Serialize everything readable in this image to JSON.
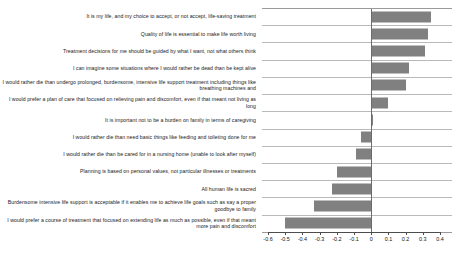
{
  "chart_data": {
    "type": "bar",
    "orientation": "horizontal",
    "title": "",
    "subtitle": "",
    "xlabel": "",
    "ylabel": "",
    "xlim": [
      -0.6,
      0.4
    ],
    "grid": true,
    "legend": null,
    "bar_color": "#808080",
    "zero_line_color": "#6b6b6b",
    "tick_labels": [
      "-0.6",
      "-0.5",
      "-0.4",
      "-0.3",
      "-0.2",
      "-0.1",
      "0",
      "0.1",
      "0.2",
      "0.3",
      "0.4"
    ],
    "ticks": [
      -0.6,
      -0.5,
      -0.4,
      -0.3,
      -0.2,
      -0.1,
      0,
      0.1,
      0.2,
      0.3,
      0.4
    ],
    "categories": [
      "It is my life, and my choice to accept, or not accept, life-saving treatment",
      "Quality of life is essential to make life worth living",
      "Treatment decisions for me should be guided by what I want, not what others think",
      "I can imagine some situations where I would rather be dead than be kept alive",
      "I would rather die than undergo prolonged, burdensome, intensive life support treatment including things like breathing machines and",
      "I would prefer a plan of care that focused on relieving pain and discomfort, even if that meant not living as long",
      "It is important not to be a burden on family in terms of caregiving",
      "I would rather die than need basic things like feeding and toileting done for me",
      "I would rather die than be cared for in a nursing home (unable to look after myself)",
      "Planning is based on personal values, not particular illnesses or treatments",
      "All human life is sacred",
      "Burdensome intensive life support is acceptable if it enables me to achieve life goals such as say a proper goodbye to family",
      "I would prefer a course of treatment that focused on extending life as much as possible, even if that meant more pain and discomfort"
    ],
    "values": [
      0.35,
      0.33,
      0.31,
      0.22,
      0.2,
      0.1,
      0.01,
      -0.06,
      -0.09,
      -0.2,
      -0.23,
      -0.33,
      -0.5
    ]
  }
}
